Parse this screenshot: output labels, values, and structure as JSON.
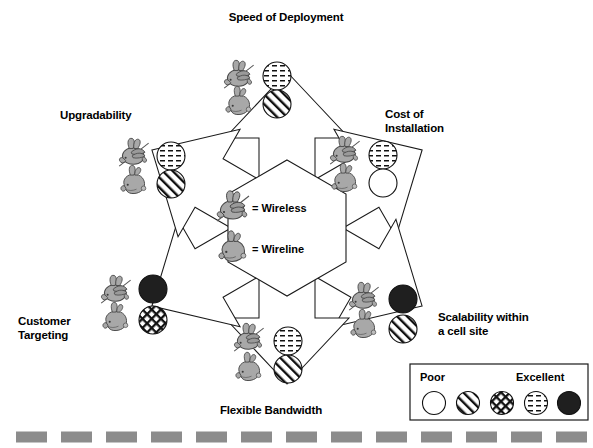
{
  "diagram": {
    "title_hidden": "",
    "center_key": {
      "wireless_label": "= Wireless",
      "wireline_label": "= Wireline",
      "wireless_icon": "flying-rabbit-icon",
      "wireline_icon": "sitting-rabbit-icon"
    },
    "axes": [
      {
        "id": "speed-of-deployment",
        "label": "Speed of Deployment",
        "wireless_rating": "very-good",
        "wireline_rating": "fair"
      },
      {
        "id": "cost-of-installation",
        "label": "Cost of\nInstallation",
        "wireless_rating": "very-good",
        "wireline_rating": "poor"
      },
      {
        "id": "scalability-within-a-cell-site",
        "label": "Scalability within\na cell site",
        "wireless_rating": "excellent",
        "wireline_rating": "fair"
      },
      {
        "id": "flexible-bandwidth",
        "label": "Flexible Bandwidth",
        "wireless_rating": "very-good",
        "wireline_rating": "fair"
      },
      {
        "id": "customer-targeting",
        "label": "Customer\nTargeting",
        "wireless_rating": "excellent",
        "wireline_rating": "good"
      },
      {
        "id": "upgradability",
        "label": "Upgradability",
        "wireless_rating": "very-good",
        "wireline_rating": "fair"
      }
    ]
  },
  "legend": {
    "poor_label": "Poor",
    "excellent_label": "Excellent",
    "scale": [
      "poor",
      "fair",
      "good",
      "very-good",
      "excellent"
    ]
  },
  "colors": {
    "line": "#000000",
    "rabbit_fill": "#a8a8a8",
    "rabbit_stroke": "#4a4a4a",
    "solid_swatch": "#1f1f1f",
    "footer_dash": "#8c8c8c",
    "background": "#ffffff"
  },
  "footer": {
    "dash_count": 15,
    "dash_color": "#8c8c8c"
  }
}
